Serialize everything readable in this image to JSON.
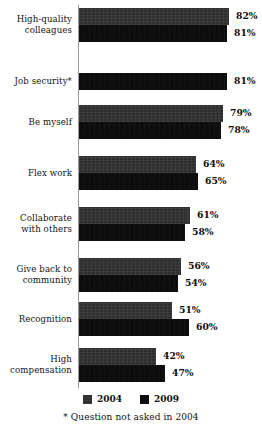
{
  "chart_data": {
    "type": "bar",
    "orientation": "horizontal",
    "title": "",
    "subtitle": "",
    "xlabel": "",
    "ylabel": "",
    "xlim": [
      0,
      100
    ],
    "grid": false,
    "legend_position": "bottom-center",
    "value_suffix": "%",
    "categories": [
      "High-quality colleagues",
      "Job security*",
      "Be myself",
      "Flex work",
      "Collaborate with others",
      "Give back to community",
      "Recognition",
      "High compensation"
    ],
    "category_lines": [
      [
        "High-quality",
        "colleagues"
      ],
      [
        "Job security*"
      ],
      [
        "Be myself"
      ],
      [
        "Flex work"
      ],
      [
        "Collaborate",
        "with others"
      ],
      [
        "Give back to",
        "community"
      ],
      [
        "Recognition"
      ],
      [
        "High",
        "compensation"
      ]
    ],
    "series": [
      {
        "name": "2004",
        "color": "#2f2f2f",
        "values": [
          82,
          null,
          79,
          64,
          61,
          56,
          51,
          42
        ],
        "labels": [
          "82%",
          "",
          "79%",
          "64%",
          "61%",
          "56%",
          "51%",
          "42%"
        ]
      },
      {
        "name": "2009",
        "color": "#0d0d0d",
        "values": [
          81,
          81,
          78,
          65,
          58,
          54,
          60,
          47
        ],
        "labels": [
          "81%",
          "81%",
          "78%",
          "65%",
          "58%",
          "54%",
          "60%",
          "47%"
        ]
      }
    ],
    "annotations": [
      "* Question not asked in 2004"
    ]
  },
  "legend": {
    "items": [
      {
        "label": "2004",
        "swatch": "legend-swatch-2004"
      },
      {
        "label": "2009",
        "swatch": "legend-swatch-2009"
      }
    ]
  },
  "footnote": {
    "text": "* Question not asked in 2004"
  }
}
